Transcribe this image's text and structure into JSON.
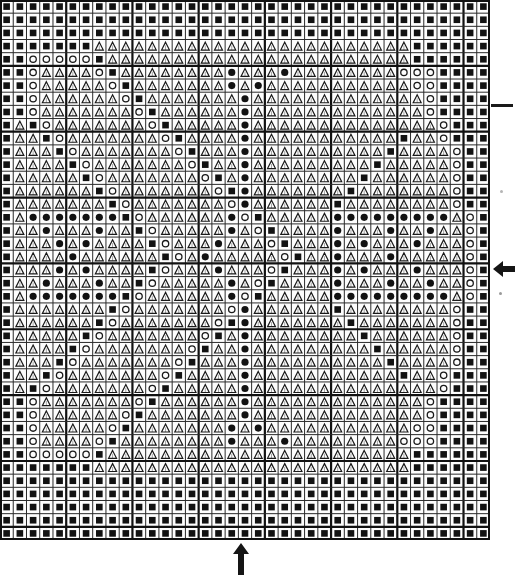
{
  "document": {
    "title": "Cross Stitch Pattern Chart",
    "type": "counted-cross-stitch-chart",
    "description": "Symmetric geometric needlework chart grid"
  },
  "grid": {
    "columns": 37,
    "rows": 41,
    "cell_size_px": 13.24,
    "origin_x_px": 0,
    "origin_y_px": 0,
    "width_px": 490,
    "height_px": 540,
    "thin_line_color": "#2b2b2b",
    "thick_line_color": "#111111",
    "thin_line_width": 1,
    "thick_line_width": 2.2,
    "thick_line_every": 5,
    "background_color": "#fdfdfd"
  },
  "legend": {
    "symbols": [
      {
        "code": "S",
        "name": "filled-square",
        "glyph": "■",
        "color": "#121212"
      },
      {
        "code": "T",
        "name": "triangle-outline",
        "glyph": "△",
        "color": "#1a1a1a"
      },
      {
        "code": "O",
        "name": "open-circle",
        "glyph": "○",
        "color": "#1a1a1a"
      },
      {
        "code": "C",
        "name": "filled-circle",
        "glyph": "●",
        "color": "#121212"
      },
      {
        "code": ".",
        "name": "blank-cell",
        "glyph": "",
        "color": "#ffffff"
      }
    ]
  },
  "markers": {
    "right_arrow": {
      "name": "center-row-arrow-left",
      "direction": "left",
      "row_index": 20,
      "color": "#151515"
    },
    "bottom_arrow": {
      "name": "center-column-arrow-up",
      "direction": "up",
      "column_index": 18,
      "color": "#151515"
    },
    "right_tick": {
      "name": "row-tick-mark",
      "row_index": 8,
      "color": "#1a1a1a"
    }
  },
  "chart_data": {
    "type": "heatmap",
    "title": "Cross Stitch Pattern Chart",
    "xlabel": "",
    "ylabel": "",
    "categories": [],
    "legend_position": "none",
    "grid": true,
    "symbol_rows": [
      "SSSSSSSSSSSSSSSSSSSSSSSSSSSSSSSSSSSSS",
      "SSSSSSSSSSSSSSSSSSSSSSSSSSSSSSSSSSSSS",
      "SSSSSSSSSSSSSSSSSSSSSSSSSSSSSSSSSSSSS",
      "SSSSSSSTTTTTTTTTTTTTTTTTTTTTTTTSSSSSS",
      "SSOOOOOSTTTTTTTTTTTTTTTTTTTTTTTSSSSSS",
      "SSOTTTTOSTTTTTTTTCTTTCTTTTTTTTOOOSSSS",
      "SSOTTTTTOSTTTTTTTCTCTTTTTTTTTTTOOSSSS",
      "SSOTTTTTTOSTTTTTTTCTTTTTTTTTTTTTOSSSS",
      "SSOTTTTTTTOSTTTTTTCTTTTTTTTTTTTTOSSSS",
      "STSOTTTTTTTOSTTTTTCTTTTTTTTTTTTTTOSSS",
      "STTSOTTTTTTTOSTTTTCTTTTTTTTTTTSTTOSSS",
      "STTTSOTTTTTTTOSTTTCTTTTTTTTTTSTTTTOSS",
      "STTTTSOTTTTTTTOSTTCTTTTTTTTTSTTTTTOSS",
      "STTTTTSOTTTTTTTOSTCTTTTTTTTSTTTTTTOSS",
      "STTTTTTSOTTTTTTTOSCTTTTTTTSTTTTTTTOSS",
      "STTTTTTTSOTTTTTTTOCTTTTTTSTTTTTTTTOSS",
      "STCCCCCCCSOTTTTTTCOSTTTTTCCCCCCCCCTOS",
      "STTCTTTCTTSOTTTTTCTOSTTTTCTTTCTTCTTOS",
      "STTTCTCTTTTSOTTTCTTTOSTTTCTCTTTCTTTOS",
      "STTTTCTTTTTTSOTCTTTTTOSTTCTTTCTTTTTOS",
      "STTTCTCTTTTSOTTTCTTTOSTTTCTCTTTCTTTOS",
      "STTCTTTCTTSOTTTTTCTOSTTTTCTTTCTTCTTOS",
      "STCCCCCCCSOTTTTTTCOSTTTTTCCCCCCCCCTOS",
      "STTTTTTTSOTTTTTTTOCTTTTTTSTTTTTTTTOSS",
      "STTTTTTSOTTTTTTTOSCTTTTTTTSTTTTTTTOSS",
      "STTTTTSOTTTTTTTOSTCTTTTTTTTSTTTTTTOSS",
      "STTTTSOTTTTTTTOSTTCTTTTTTTTTSTTTTTOSS",
      "STTTSOTTTTTTTOSTTTCTTTTTTTTTTSTTTTOSS",
      "STTSOTTTTTTTOSTTTTCTTTTTTTTTTTSTTOSSS",
      "STSOTTTTTTTOSTTTTTCTTTTTTTTTTTTTTOSSS",
      "SSOTTTTTTTOSTTTTTTCTTTTTTTTTTTTTOSSSS",
      "SSOTTTTTTOSTTTTTTTCTTTTTTTTTTTTTOSSSS",
      "SSOTTTTTOSTTTTTTTCTCTTTTTTTTTTTOOSSSS",
      "SSOTTTTOSTTTTTTTTCTTTCTTTTTTTTOOOSSSS",
      "SSOOOOOSTTTTTTTTTTTTTTTTTTTTTTTSSSSSS",
      "SSSSSSSTTTTTTTTTTTTTTTTTTTTTTTTSSSSSS",
      "SSSSSSSSSSSSSSSSSSSSSSSSSSSSSSSSSSSSS",
      "SSSSSSSSSSSSSSSSSSSSSSSSSSSSSSSSSSSSS",
      "SSSSSSSSSSSSSSSSSSSSSSSSSSSSSSSSSSSSS",
      "SSSSSSSSSSSSSSSSSSSSSSSSSSSSSSSSSSSSS",
      "SSSSSSSSSSSSSSSSSSSSSSSSSSSSSSSSSSSSS"
    ]
  }
}
